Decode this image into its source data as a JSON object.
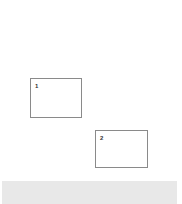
{
  "canvas": {
    "boxes": [
      {
        "label": "1"
      },
      {
        "label": "2"
      }
    ]
  },
  "colors": {
    "background": "#ffffff",
    "box_border": "#8a8a8a",
    "bottom_bar": "#e8e8e8"
  }
}
